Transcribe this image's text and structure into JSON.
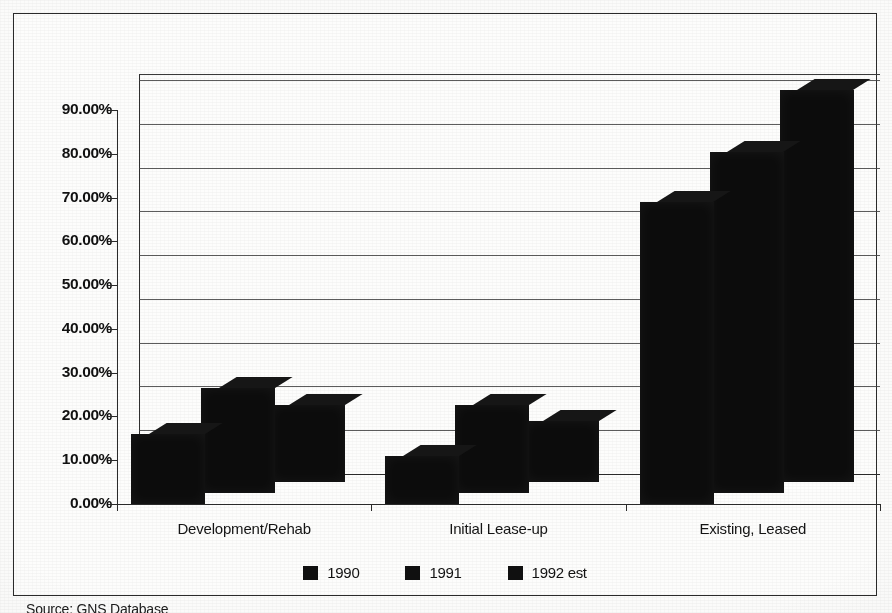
{
  "chart_data": {
    "type": "bar",
    "title": "",
    "xlabel": "",
    "ylabel": "",
    "categories": [
      "Development/Rehab",
      "Initial Lease-up",
      "Existing, Leased"
    ],
    "series": [
      {
        "name": "1990",
        "values": [
          16.0,
          11.0,
          69.0
        ]
      },
      {
        "name": "1991",
        "values": [
          24.0,
          20.0,
          78.0
        ]
      },
      {
        "name": "1992 est",
        "values": [
          17.5,
          14.0,
          89.5
        ]
      }
    ],
    "ylim": [
      0,
      90
    ],
    "ytick_values": [
      0,
      10,
      20,
      30,
      40,
      50,
      60,
      70,
      80,
      90
    ],
    "ytick_labels": [
      "0.00%",
      "10.00%",
      "20.00%",
      "30.00%",
      "40.00%",
      "50.00%",
      "60.00%",
      "70.00%",
      "80.00%",
      "90.00%"
    ],
    "grid": true,
    "legend_position": "bottom",
    "series_color": "#101010",
    "three_d": true
  },
  "legend": {
    "items": [
      {
        "label": "1990"
      },
      {
        "label": "1991"
      },
      {
        "label": "1992 est"
      }
    ]
  },
  "footer": {
    "source": "Source: GNS Database"
  },
  "colors": {
    "bar": "#101010",
    "axis": "#2b2b2b",
    "grid": "#3f3f3f",
    "frame": "#2b2b2b",
    "page": "#fbfbfa"
  }
}
